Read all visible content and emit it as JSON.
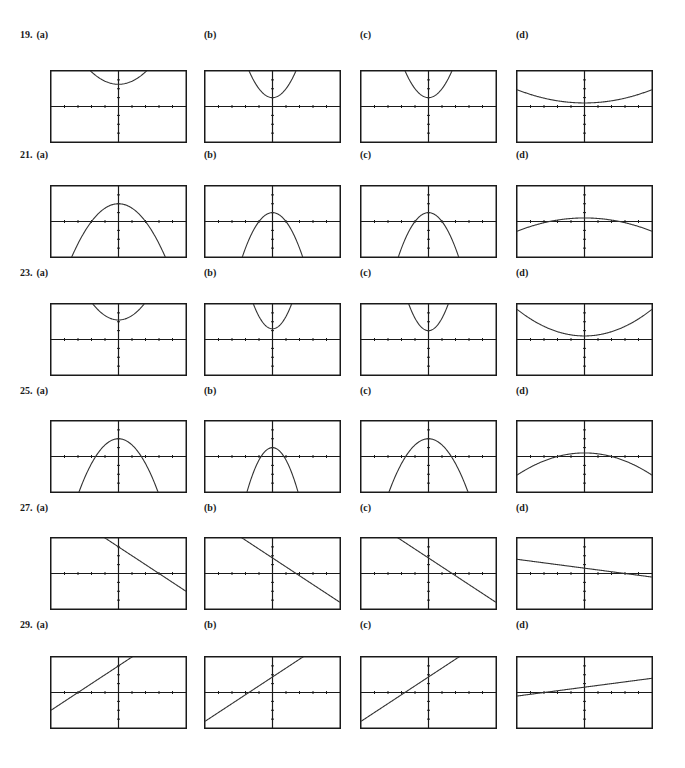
{
  "problems": [
    {
      "number": "19.",
      "parts": [
        {
          "label": "(a)",
          "kind": "parabola",
          "a": 0.35,
          "h": 0,
          "k": 2.5
        },
        {
          "label": "(b)",
          "kind": "parabola",
          "a": 1.0,
          "h": 0,
          "k": 1.0
        },
        {
          "label": "(c)",
          "kind": "parabola",
          "a": 1.0,
          "h": 0,
          "k": 1.0
        },
        {
          "label": "(d)",
          "kind": "parabola",
          "a": 0.06,
          "h": 0,
          "k": 0.4
        }
      ]
    },
    {
      "number": "21.",
      "parts": [
        {
          "label": "(a)",
          "kind": "parabola",
          "a": -0.5,
          "h": 0,
          "k": 2.0
        },
        {
          "label": "(b)",
          "kind": "parabola",
          "a": -1.0,
          "h": 0,
          "k": 1.0
        },
        {
          "label": "(c)",
          "kind": "parabola",
          "a": -1.0,
          "h": 0,
          "k": 1.0
        },
        {
          "label": "(d)",
          "kind": "parabola",
          "a": -0.06,
          "h": 0,
          "k": 0.4
        }
      ]
    },
    {
      "number": "23.",
      "parts": [
        {
          "label": "(a)",
          "kind": "parabola",
          "a": 0.5,
          "h": 0,
          "k": 2.2
        },
        {
          "label": "(b)",
          "kind": "parabola",
          "a": 1.4,
          "h": 0,
          "k": 1.2
        },
        {
          "label": "(c)",
          "kind": "parabola",
          "a": 1.4,
          "h": 0,
          "k": 1.0
        },
        {
          "label": "(d)",
          "kind": "parabola",
          "a": 0.12,
          "h": 0,
          "k": 0.4
        }
      ]
    },
    {
      "number": "25.",
      "parts": [
        {
          "label": "(a)",
          "kind": "parabola",
          "a": -0.7,
          "h": 0,
          "k": 2.0
        },
        {
          "label": "(b)",
          "kind": "parabola",
          "a": -1.4,
          "h": 0,
          "k": 1.0
        },
        {
          "label": "(c)",
          "kind": "parabola",
          "a": -0.7,
          "h": 0,
          "k": 2.0
        },
        {
          "label": "(d)",
          "kind": "parabola",
          "a": -0.1,
          "h": 0,
          "k": 0.4
        }
      ]
    },
    {
      "number": "27.",
      "parts": [
        {
          "label": "(a)",
          "kind": "line",
          "m": -1.0,
          "b": 3.0
        },
        {
          "label": "(b)",
          "kind": "line",
          "m": -1.0,
          "b": 1.75
        },
        {
          "label": "(c)",
          "kind": "line",
          "m": -1.0,
          "b": 1.75
        },
        {
          "label": "(d)",
          "kind": "line",
          "m": -0.2,
          "b": 0.6
        }
      ]
    },
    {
      "number": "29.",
      "parts": [
        {
          "label": "(a)",
          "kind": "line",
          "m": 1.0,
          "b": 3.0
        },
        {
          "label": "(b)",
          "kind": "line",
          "m": 1.0,
          "b": 1.75
        },
        {
          "label": "(c)",
          "kind": "line",
          "m": 1.0,
          "b": 1.75
        },
        {
          "label": "(d)",
          "kind": "line",
          "m": 0.2,
          "b": 0.6
        }
      ]
    }
  ],
  "window": {
    "xmin": -5,
    "xmax": 5,
    "ymin": -4,
    "ymax": 4,
    "xticks": 10,
    "yticks": 8
  },
  "colors": {
    "ink": "#1a1a1a",
    "curve": "#333333"
  },
  "chart_data": {
    "type": "line",
    "xlabel": "",
    "ylabel": "",
    "xlim": [
      -5,
      5
    ],
    "ylim": [
      -4,
      4
    ],
    "grid": false
  }
}
